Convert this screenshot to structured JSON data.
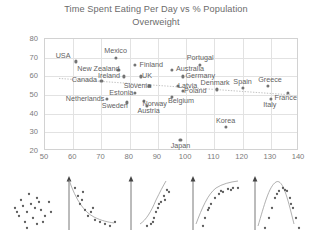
{
  "chart_data": {
    "type": "scatter",
    "title": "Time Spent Eating Per Day vs % Population Overweight",
    "title_line1": "Time Spent Eating Per Day vs % Population",
    "title_line2": "Overweight",
    "xlabel": "",
    "ylabel": "",
    "xlim": [
      50,
      140
    ],
    "ylim": [
      20,
      80
    ],
    "xticks": [
      50,
      60,
      70,
      80,
      90,
      100,
      110,
      120,
      130,
      140
    ],
    "yticks": [
      20,
      30,
      40,
      50,
      60,
      70,
      80
    ],
    "grid": true,
    "legend": "none",
    "trendline": {
      "type": "linear-fit",
      "style": "dotted",
      "color": "#b9b9b9",
      "x_start": 55,
      "y_start": 58.5,
      "x_end": 138,
      "y_end": 49.5
    },
    "points": [
      {
        "label": "USA",
        "x": 61,
        "y": 68,
        "label_dx": -13,
        "label_dy": -5
      },
      {
        "label": "Mexico",
        "x": 75,
        "y": 70,
        "label_dx": 0,
        "label_dy": -7
      },
      {
        "label": "Finland",
        "x": 82,
        "y": 66,
        "label_dx": 16,
        "label_dy": 0
      },
      {
        "label": "Portugal",
        "x": 105,
        "y": 66,
        "label_dx": 0,
        "label_dy": -7
      },
      {
        "label": "New Zealand",
        "x": 76,
        "y": 63.5,
        "label_dx": -20,
        "label_dy": -1
      },
      {
        "label": "Australia",
        "x": 95,
        "y": 63.5,
        "label_dx": 18,
        "label_dy": -1
      },
      {
        "label": "Ireland",
        "x": 78,
        "y": 60,
        "label_dx": -15,
        "label_dy": 0
      },
      {
        "label": "UK",
        "x": 84,
        "y": 60,
        "label_dx": 6,
        "label_dy": 0
      },
      {
        "label": "Germany",
        "x": 99,
        "y": 60,
        "label_dx": 17,
        "label_dy": 0
      },
      {
        "label": "Canada",
        "x": 70,
        "y": 57.5,
        "label_dx": -17,
        "label_dy": -1
      },
      {
        "label": "Slovenia",
        "x": 87,
        "y": 55,
        "label_dx": -12,
        "label_dy": 0
      },
      {
        "label": "Latvia",
        "x": 97,
        "y": 55,
        "label_dx": 10,
        "label_dy": 0
      },
      {
        "label": "Denmark",
        "x": 111,
        "y": 53,
        "label_dx": -2,
        "label_dy": -6
      },
      {
        "label": "Spain",
        "x": 120,
        "y": 54,
        "label_dx": 0,
        "label_dy": -6
      },
      {
        "label": "Greece",
        "x": 129,
        "y": 55,
        "label_dx": 2,
        "label_dy": -6
      },
      {
        "label": "Estonia",
        "x": 82,
        "y": 51,
        "label_dx": -14,
        "label_dy": 0
      },
      {
        "label": "Poland",
        "x": 99,
        "y": 52,
        "label_dx": 12,
        "label_dy": 0
      },
      {
        "label": "France",
        "x": 136,
        "y": 51,
        "label_dx": -2,
        "label_dy": 5
      },
      {
        "label": "Netherlands",
        "x": 72,
        "y": 48,
        "label_dx": -22,
        "label_dy": 0
      },
      {
        "label": "Belgium",
        "x": 95,
        "y": 49,
        "label_dx": 9,
        "label_dy": 4
      },
      {
        "label": "Sweden",
        "x": 79,
        "y": 46,
        "label_dx": -12,
        "label_dy": 4
      },
      {
        "label": "Norway",
        "x": 85,
        "y": 47,
        "label_dx": 11,
        "label_dy": 3
      },
      {
        "label": "Austria",
        "x": 86,
        "y": 44,
        "label_dx": 2,
        "label_dy": 5
      },
      {
        "label": "Italy",
        "x": 130,
        "y": 48,
        "label_dx": -1,
        "label_dy": 6
      },
      {
        "label": "Korea",
        "x": 114,
        "y": 33,
        "label_dx": 0,
        "label_dy": -6
      },
      {
        "label": "Japan",
        "x": 98,
        "y": 26,
        "label_dx": 0,
        "label_dy": 6
      }
    ]
  },
  "thumbnails": {
    "items": [
      {
        "name": "no-correlation-scatter",
        "has_axis": false,
        "has_curve": false
      },
      {
        "name": "decreasing-decay-scatter",
        "has_axis": true,
        "has_curve": true
      },
      {
        "name": "increasing-exponential-scatter",
        "has_axis": true,
        "has_curve": true
      },
      {
        "name": "logarithmic-saturating-scatter",
        "has_axis": true,
        "has_curve": true
      },
      {
        "name": "bell-peak-scatter",
        "has_axis": true,
        "has_curve": true
      }
    ]
  }
}
